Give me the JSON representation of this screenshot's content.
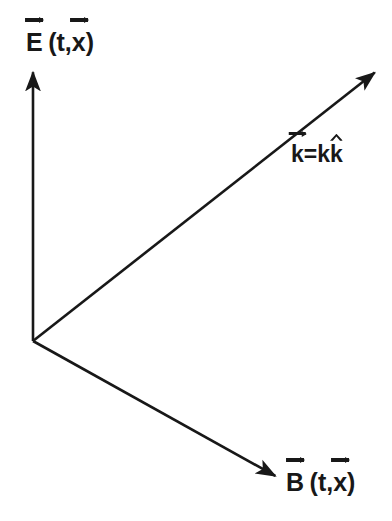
{
  "figure": {
    "background_color": "#ffffff",
    "stroke_color": "#181818",
    "width": 392,
    "height": 521
  },
  "labels": {
    "E": {
      "base": "E",
      "accent": "arrow",
      "argument_open": "(",
      "argument_t": "t",
      "argument_comma": ",",
      "argument_x": "x",
      "argument_x_accent": "arrow",
      "argument_close": ")",
      "plain_text": "E⃗ (t,x⃗)"
    },
    "k": {
      "lhs_base": "k",
      "lhs_accent": "arrow",
      "equals": "=",
      "rhs_scalar": "k",
      "rhs_base": "k",
      "rhs_accent": "hat",
      "plain_text": "k⃗=kk̂"
    },
    "B": {
      "base": "B",
      "accent": "arrow",
      "argument_open": "(",
      "argument_t": "t",
      "argument_comma": ",",
      "argument_x": "x",
      "argument_x_accent": "arrow",
      "argument_close": ")",
      "plain_text": "B⃗ (t,x⃗)"
    }
  },
  "chart_data": {
    "type": "diagram",
    "subtype": "vector-field-triad",
    "origin": {
      "x": 33,
      "y": 341
    },
    "vectors": [
      {
        "name": "E",
        "label": "E⃗ (t,x⃗)",
        "from": {
          "x": 33,
          "y": 341
        },
        "to": {
          "x": 33,
          "y": 68
        },
        "direction_deg": 90,
        "color": "#181818",
        "stroke_width": 2.6,
        "arrowhead": true
      },
      {
        "name": "k",
        "label": "k⃗=kk̂",
        "from": {
          "x": 33,
          "y": 341
        },
        "to": {
          "x": 378,
          "y": 70
        },
        "direction_deg": 38,
        "color": "#181818",
        "stroke_width": 2.6,
        "arrowhead": true
      },
      {
        "name": "B",
        "label": "B⃗ (t,x⃗)",
        "from": {
          "x": 33,
          "y": 341
        },
        "to": {
          "x": 279,
          "y": 478
        },
        "direction_deg": -29,
        "color": "#181818",
        "stroke_width": 2.6,
        "arrowhead": true
      }
    ],
    "grid": false,
    "legend": false,
    "axes": false
  }
}
